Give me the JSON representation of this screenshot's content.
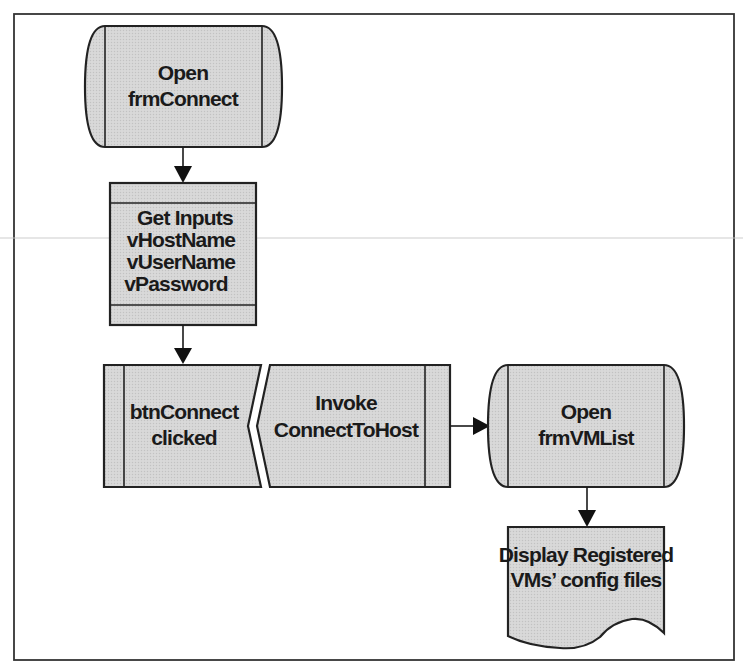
{
  "diagram": {
    "type": "flowchart",
    "colors": {
      "shape_fill": "#d4d4d4",
      "stroke": "#222222",
      "frame": "#333333",
      "background": "#ffffff",
      "text": "#1a1a1a"
    },
    "nodes": [
      {
        "id": "open-frmconnect",
        "shape": "stored-data-terminal",
        "lines": [
          "Open",
          "frmConnect"
        ]
      },
      {
        "id": "get-inputs",
        "shape": "internal-storage",
        "lines": [
          "Get Inputs",
          "vHostName",
          "vUserName",
          "vPassword"
        ]
      },
      {
        "id": "btnconnect-clicked",
        "shape": "predefined-process-event",
        "lines": [
          "btnConnect",
          "clicked"
        ]
      },
      {
        "id": "invoke-connecttohost",
        "shape": "predefined-process-invoke",
        "lines": [
          "Invoke",
          "ConnectToHost"
        ]
      },
      {
        "id": "open-frmvmlist",
        "shape": "stored-data-terminal",
        "lines": [
          "Open",
          "frmVMList"
        ]
      },
      {
        "id": "display-registered",
        "shape": "document",
        "lines": [
          "Display Registered",
          "VMs’ config files"
        ]
      }
    ],
    "edges": [
      {
        "from": "open-frmconnect",
        "to": "get-inputs"
      },
      {
        "from": "get-inputs",
        "to": "btnconnect-clicked"
      },
      {
        "from": "invoke-connecttohost",
        "to": "open-frmvmlist"
      },
      {
        "from": "open-frmvmlist",
        "to": "display-registered"
      }
    ]
  }
}
